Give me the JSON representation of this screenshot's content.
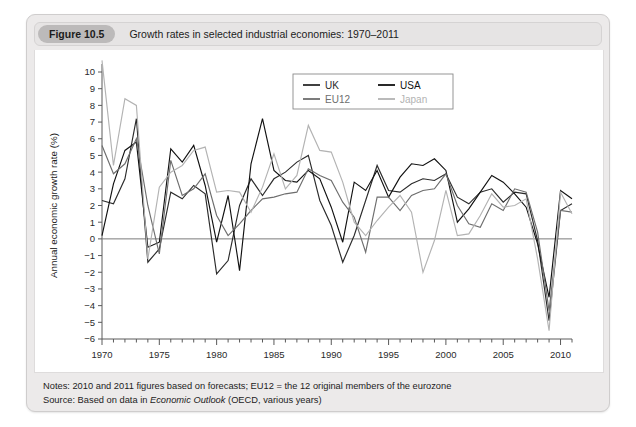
{
  "figure": {
    "badge": "Figure 10.5",
    "title": "Growth rates in selected industrial economies: 1970–2011",
    "notes_line1": "Notes: 2010 and 2011 figures based on forecasts; EU12 = the 12 original members of the eurozone",
    "notes_source_prefix": "Source: Based on data in ",
    "notes_source_italic": "Economic Outlook",
    "notes_source_suffix": " (OECD, various years)"
  },
  "colors": {
    "panel_bg": "#eceaea",
    "header_bg": "#e6e4e4",
    "badge_bg": "#bcbaba",
    "plot_bg": "#ffffff",
    "uk": "#2b2b2b",
    "usa": "#111111",
    "eu12": "#6e6e6e",
    "japan": "#b3b3b3",
    "axis": "#5a5a5a"
  },
  "chart_data": {
    "type": "line",
    "title": "Growth rates in selected industrial economies: 1970–2011",
    "xlabel": "",
    "ylabel": "Annual economic growth rate (%)",
    "xlim": [
      1970,
      2011
    ],
    "ylim": [
      -6,
      10
    ],
    "xticks": [
      1970,
      1975,
      1980,
      1985,
      1990,
      1995,
      2000,
      2005,
      2010
    ],
    "xtick_labels": [
      "1970",
      "1975",
      "1980",
      "1985",
      "1990",
      "1995",
      "2000",
      "2005",
      "2010"
    ],
    "yticks": [
      -6,
      -5,
      -4,
      -3,
      -2,
      -1,
      0,
      1,
      2,
      3,
      4,
      5,
      6,
      7,
      8,
      9,
      10
    ],
    "ytick_labels": [
      "−6",
      "−5",
      "−4",
      "−3",
      "−2",
      "−1",
      "0",
      "1",
      "2",
      "3",
      "4",
      "5",
      "6",
      "7",
      "8",
      "9",
      "10"
    ],
    "grid": false,
    "zero_line": true,
    "legend_position": "top-right",
    "legend_entries": [
      "UK",
      "USA",
      "EU12",
      "Japan"
    ],
    "x": [
      1970,
      1971,
      1972,
      1973,
      1974,
      1975,
      1976,
      1977,
      1978,
      1979,
      1980,
      1981,
      1982,
      1983,
      1984,
      1985,
      1986,
      1987,
      1988,
      1989,
      1990,
      1991,
      1992,
      1993,
      1994,
      1995,
      1996,
      1997,
      1998,
      1999,
      2000,
      2001,
      2002,
      2003,
      2004,
      2005,
      2006,
      2007,
      2008,
      2009,
      2010,
      2011
    ],
    "series": [
      {
        "name": "UK",
        "color": "#2b2b2b",
        "values": [
          2.3,
          2.1,
          3.6,
          7.2,
          -1.4,
          -0.6,
          2.8,
          2.4,
          3.2,
          2.7,
          -2.1,
          -1.3,
          2.0,
          3.6,
          2.6,
          3.6,
          4.0,
          4.6,
          5.0,
          2.3,
          0.8,
          -1.4,
          0.2,
          2.3,
          4.4,
          2.9,
          2.8,
          3.3,
          3.6,
          3.5,
          3.9,
          2.5,
          2.1,
          2.8,
          3.0,
          2.2,
          2.8,
          2.7,
          -0.1,
          -4.9,
          1.7,
          2.1
        ]
      },
      {
        "name": "USA",
        "color": "#111111",
        "values": [
          0.2,
          3.3,
          5.3,
          5.8,
          -0.5,
          -0.2,
          5.4,
          4.6,
          5.6,
          3.2,
          -0.2,
          2.6,
          -1.9,
          4.5,
          7.2,
          4.1,
          3.5,
          3.4,
          4.1,
          3.6,
          1.9,
          -0.2,
          3.4,
          2.9,
          4.1,
          2.5,
          3.7,
          4.5,
          4.4,
          4.8,
          4.1,
          1.0,
          1.8,
          2.8,
          3.8,
          3.4,
          2.7,
          1.9,
          -0.3,
          -3.5,
          2.9,
          2.4
        ]
      },
      {
        "name": "EU12",
        "color": "#6e6e6e",
        "values": [
          5.6,
          3.9,
          4.5,
          6.0,
          2.0,
          -0.9,
          4.7,
          2.6,
          3.0,
          3.9,
          1.4,
          0.2,
          0.9,
          1.7,
          2.4,
          2.5,
          2.7,
          2.8,
          4.2,
          3.8,
          3.5,
          2.2,
          1.3,
          -0.8,
          2.5,
          2.5,
          1.7,
          2.6,
          2.9,
          3.0,
          3.9,
          2.0,
          0.9,
          0.7,
          2.1,
          1.7,
          3.0,
          2.8,
          0.4,
          -4.3,
          1.7,
          1.6
        ]
      },
      {
        "name": "Japan",
        "color": "#b3b3b3",
        "values": [
          10.7,
          4.4,
          8.4,
          8.0,
          -1.2,
          3.1,
          4.0,
          4.4,
          5.3,
          5.5,
          2.8,
          2.9,
          2.8,
          1.6,
          3.1,
          5.1,
          3.0,
          3.8,
          6.8,
          5.3,
          5.2,
          3.4,
          1.0,
          0.2,
          1.1,
          1.9,
          2.6,
          1.6,
          -2.0,
          -0.1,
          2.9,
          0.2,
          0.3,
          1.4,
          2.7,
          1.9,
          2.0,
          2.4,
          -1.2,
          -5.5,
          2.8,
          1.5
        ]
      }
    ]
  }
}
